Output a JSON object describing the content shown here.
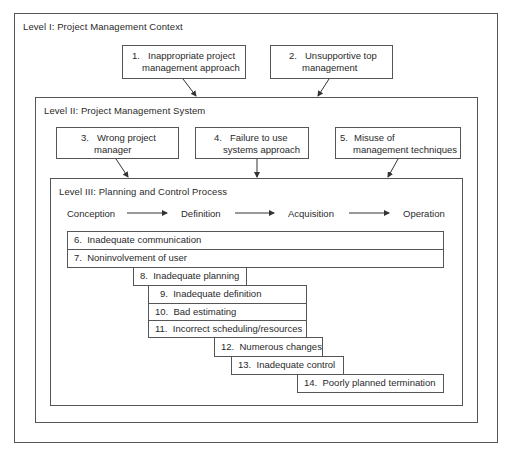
{
  "levels": {
    "level1": {
      "title": "Level I:  Project Management Context"
    },
    "level2": {
      "title": "Level II:  Project Management System"
    },
    "level3": {
      "title": "Level III:  Planning and Control Process"
    }
  },
  "context_causes": [
    {
      "num": "1.",
      "line1": "Inappropriate project",
      "line2": "management approach"
    },
    {
      "num": "2.",
      "line1": "Unsupportive top",
      "line2": "management"
    }
  ],
  "system_causes": [
    {
      "num": "3.",
      "line1": "Wrong project",
      "line2": "manager"
    },
    {
      "num": "4.",
      "line1": "Failure to use",
      "line2": "systems approach"
    },
    {
      "num": "5.",
      "line1": "Misuse of",
      "line2": "management techniques"
    }
  ],
  "phases": [
    "Conception",
    "Definition",
    "Acquisition",
    "Operation"
  ],
  "process_causes": [
    {
      "num": "6.",
      "label": "Inadequate communication"
    },
    {
      "num": "7.",
      "label": "Noninvolvement of user"
    },
    {
      "num": "8.",
      "label": "Inadequate planning"
    },
    {
      "num": "9.",
      "label": "Inadequate definition"
    },
    {
      "num": "10.",
      "label": "Bad estimating"
    },
    {
      "num": "11.",
      "label": "Incorrect scheduling/resources"
    },
    {
      "num": "12.",
      "label": "Numerous changes"
    },
    {
      "num": "13.",
      "label": "Inadequate control"
    },
    {
      "num": "14.",
      "label": "Poorly planned termination"
    }
  ]
}
